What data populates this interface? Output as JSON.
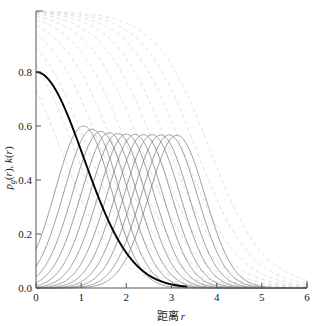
{
  "chart_data": {
    "type": "line",
    "title": "",
    "xlabel": "距离 r",
    "ylabel": "p_g(r), k(r)",
    "xlim": [
      0,
      6
    ],
    "ylim": [
      0.0,
      1.026
    ],
    "xticks": [
      "0",
      "1",
      "2",
      "3",
      "4",
      "5",
      "6"
    ],
    "xtick_values": [
      0,
      1,
      2,
      3,
      4,
      5,
      6
    ],
    "yticks": [
      "0.0",
      "0.2",
      "0.4",
      "0.6",
      "0.8"
    ],
    "ytick_values": [
      0.0,
      0.2,
      0.4,
      0.6,
      0.8
    ],
    "grid": false,
    "legend": "none",
    "series": [
      {
        "name": "p_g(r)",
        "style": "solid-thick-black",
        "color": "#000000",
        "linewidth": 1.9,
        "kind": "gaussian-decay",
        "peak_value": 0.8,
        "center": 0.0,
        "sigma": 1.05,
        "zero_at": 3.0,
        "description": "Thick black curve starting at 0.80 at r=0 and decaying to 0 near r=3"
      },
      {
        "name": "k(r) bells",
        "style": "solid-thin-gray",
        "color": "#7a7a7a",
        "linewidth": 0.75,
        "kind": "gaussian-bumps",
        "count": 12,
        "peak_values": [
          0.6,
          0.588,
          0.58,
          0.575,
          0.572,
          0.57,
          0.569,
          0.568,
          0.568,
          0.567,
          0.567,
          0.566
        ],
        "peak_positions": [
          1.05,
          1.24,
          1.43,
          1.62,
          1.81,
          2.0,
          2.19,
          2.38,
          2.57,
          2.76,
          2.95,
          3.12
        ],
        "sigma": 0.62,
        "description": "Twelve thin gray bell curves with peaks near 0.57-0.60 shifted progressively right"
      },
      {
        "name": "cumulative sigmoids",
        "style": "dashed-light-gray",
        "color": "#d6d6d6",
        "linewidth": 0.8,
        "dash": "4 3",
        "kind": "sigmoid-decay",
        "count": 12,
        "start_value": 1.026,
        "inflections": [
          0.55,
          0.85,
          1.15,
          1.45,
          1.75,
          2.05,
          2.35,
          2.65,
          2.95,
          3.25,
          3.55,
          3.85
        ],
        "width": 0.6,
        "description": "Twelve light gray dashed sigmoid curves starting near 1.0 and falling to 0, each shifted right"
      }
    ]
  },
  "axes": {
    "spine_color": "#555555",
    "tick_color": "#555555",
    "background": "#ffffff"
  }
}
